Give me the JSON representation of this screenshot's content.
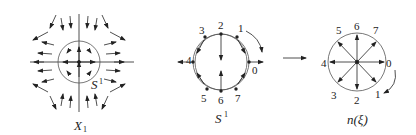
{
  "panels": {
    "left": {
      "caption": "X",
      "caption_sub": "1",
      "circle_label": "S",
      "circle_label_sup": "1"
    },
    "middle": {
      "caption": "S",
      "caption_sup": "1",
      "points": [
        "0",
        "1",
        "2",
        "3",
        "4",
        "5",
        "6",
        "7"
      ]
    },
    "right": {
      "caption": "n(ξ)",
      "points": [
        "0",
        "1",
        "2",
        "3",
        "4",
        "5",
        "6",
        "7"
      ]
    }
  },
  "colors": {
    "stroke": "#222222",
    "circle": "#555555"
  }
}
